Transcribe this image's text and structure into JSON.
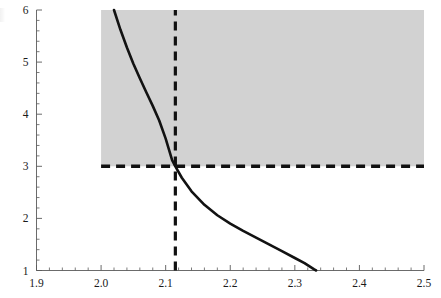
{
  "chart_data": {
    "type": "line",
    "title": "",
    "subtitle": "",
    "xlabel": "",
    "ylabel": "",
    "xlim": [
      1.9,
      2.5
    ],
    "ylim": [
      1,
      6
    ],
    "grid": false,
    "legend": null,
    "x_ticks": [
      1.9,
      2.0,
      2.1,
      2.2,
      2.3,
      2.4,
      2.5
    ],
    "x_tick_labels": [
      "1.9",
      "2.0",
      "2.1",
      "2.2",
      "2.3",
      "2.4",
      "2.5"
    ],
    "x_minor_tick_count_per_interval": 5,
    "y_ticks": [
      1,
      2,
      3,
      4,
      5,
      6
    ],
    "y_tick_labels": [
      "1",
      "2",
      "3",
      "4",
      "5",
      "6"
    ],
    "y_minor_tick_count_per_interval": 5,
    "series": [
      {
        "name": "curve",
        "style": "solid",
        "color": "#121212",
        "width": 2.6,
        "points": [
          [
            2.02,
            6.0
          ],
          [
            2.03,
            5.62
          ],
          [
            2.04,
            5.28
          ],
          [
            2.05,
            4.97
          ],
          [
            2.06,
            4.69
          ],
          [
            2.07,
            4.42
          ],
          [
            2.08,
            4.16
          ],
          [
            2.09,
            3.88
          ],
          [
            2.1,
            3.53
          ],
          [
            2.11,
            3.12
          ],
          [
            2.115,
            3.0
          ],
          [
            2.125,
            2.78
          ],
          [
            2.14,
            2.52
          ],
          [
            2.16,
            2.26
          ],
          [
            2.18,
            2.06
          ],
          [
            2.2,
            1.9
          ],
          [
            2.22,
            1.76
          ],
          [
            2.24,
            1.63
          ],
          [
            2.26,
            1.5
          ],
          [
            2.28,
            1.37
          ],
          [
            2.3,
            1.24
          ],
          [
            2.315,
            1.14
          ],
          [
            2.33,
            1.02
          ],
          [
            2.333,
            1.0
          ]
        ]
      }
    ],
    "shaded_region": {
      "name": "feasible-region",
      "color": "#d2d2d2",
      "x_range": [
        2.0,
        2.5
      ],
      "y_range": [
        3.0,
        6.0
      ]
    },
    "reference_lines": [
      {
        "name": "vertical-threshold",
        "orientation": "vertical",
        "value": 2.115,
        "style": "dashed",
        "color": "#111111",
        "y_range": [
          1,
          6
        ]
      },
      {
        "name": "horizontal-threshold",
        "orientation": "horizontal",
        "value": 3.0,
        "style": "dashed",
        "color": "#111111",
        "x_range": [
          2.0,
          2.5
        ]
      }
    ],
    "annotations": []
  },
  "figure": {
    "background_color": "#ffffff",
    "axis_color": "#5a5a5a",
    "curve_color": "#121212",
    "shade_color": "#d2d2d2",
    "dash_color": "#111111"
  }
}
